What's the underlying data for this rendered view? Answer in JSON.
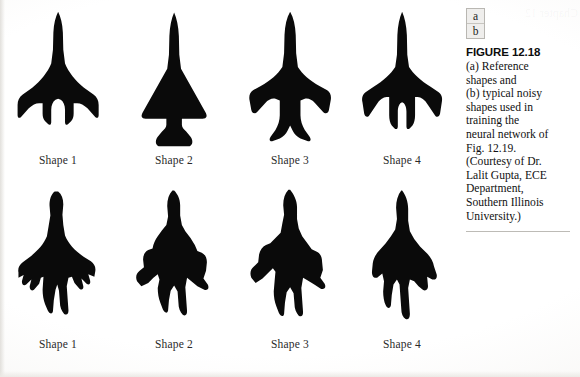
{
  "figure": {
    "panel_key": {
      "top": "a",
      "bottom": "b"
    },
    "heading": "FIGURE 12.18",
    "caption_lines": [
      "(a) Reference",
      "shapes and",
      "(b) typical noisy",
      "shapes used in",
      "training the",
      "neural network of",
      "Fig. 12.19.",
      "(Courtesy of Dr.",
      "Lalit Gupta, ECE",
      "Department,",
      "Southern Illinois",
      "University.)"
    ],
    "caption_text": "(a) Reference shapes and (b) typical noisy shapes used in training the neural network of Fig. 12.19. (Courtesy of Dr. Lalit Gupta, ECE Department, Southern Illinois University.)"
  },
  "colors": {
    "shape_fill": "#0a0a0a",
    "page_background": "#fdfdfc",
    "text": "#111111",
    "rule": "#bdbbb6"
  },
  "rows": [
    {
      "row_name": "reference-shapes",
      "shapes": [
        {
          "label": "Shape 1",
          "icon": "aircraft-silhouette-delta-wing-icon",
          "path": "M50,2 C47,8 45,16 44.5,26 L44,46 L42,62 C38,72 30,82 20,90 L9,98 C5,101 3,105 3,110 L3,122 C3,125 5,126 7,124 L16,114 C20,110 24,108 28,108 L32,108 L32,120 C32,124 33,127 35,129 L38,132 C40,134 42,133 42,130 L42,116 C42,110 44,106 47,104 L50,103 L53,104 C56,106 58,110 58,116 L58,130 C58,133 60,134 62,132 L65,129 C67,127 68,124 68,120 L68,108 L72,108 C76,108 80,110 84,114 L93,124 C95,126 97,125 97,122 L97,110 C97,105 95,101 91,98 L80,90 C70,82 62,72 58,62 L56,46 L55.5,26 C55,16 53,8 50,2 Z"
        },
        {
          "label": "Shape 2",
          "icon": "aircraft-silhouette-solid-triangle-icon",
          "path": "M50,3 C47,10 45,19 44.5,30 L44,52 L42,68 L14,118 C11,123 12,126 17,126 L83,126 C88,126 89,123 86,118 L58,68 L56,52 L55.5,30 C55,19 53,10 50,3 Z M41,126 L59,126 L59,133 C59,136 61,138 64,141 L69,147 C72,151 72,156 68,158 L32,158 C28,156 28,151 31,147 L36,141 C39,138 41,136 41,133 Z"
        },
        {
          "label": "Shape 3",
          "icon": "aircraft-silhouette-swept-wing-icon",
          "path": "M50,2 C46,9 44,18 43.5,29 L43,50 L41,66 C36,74 27,82 16,88 L7,93 C3,96 2,100 3,105 L5,116 C6,120 9,121 12,118 L21,108 C25,104 29,102 33,103 L38,105 L38,122 C38,128 36,134 33,139 L28,146 C25,150 26,153 30,152 L38,149 C42,147 45,144 47,140 L50,134 L53,140 C55,144 58,147 62,149 L70,152 C74,153 75,150 72,146 L67,139 C64,134 62,128 62,122 L62,105 L67,103 C71,102 75,104 79,108 L88,118 C91,121 94,120 95,116 L97,105 C98,100 97,96 93,93 L84,88 C73,82 64,74 59,66 L57,50 L56.5,29 C56,18 54,9 50,2 Z"
        },
        {
          "label": "Shape 4",
          "icon": "aircraft-silhouette-trident-icon",
          "path": "M50,2 C47,9 45,18 44.5,29 L44,52 L42,66 C37,74 28,82 17,89 L8,95 C4,98 3,102 4,107 L6,120 C7,124 10,125 12,122 L20,110 C24,104 28,101 32,101 L35,101 L35,122 C35,127 36,131 38,134 L41,137 C43,139 45,138 45,135 L45,118 C45,112 47,108 50,107 C53,108 55,112 55,118 L55,135 C55,138 57,139 59,137 L62,134 C64,131 65,127 65,122 L65,101 L68,101 C72,101 76,104 80,110 L88,122 C90,125 93,124 94,120 L96,107 C97,102 96,98 92,95 L83,89 C72,82 63,74 58,66 L56,52 L55.5,29 C55,18 53,9 50,2 Z"
        }
      ]
    },
    {
      "row_name": "noisy-shapes",
      "shapes": [
        {
          "label": "Shape 1",
          "icon": "noisy-aircraft-silhouette-delta-wing-icon",
          "path": "M46,4 C42,7 40,13 40,20 L41,32 L39,44 L37,56 C33,66 25,74 16,81 L9,86 C5,89 3,93 4,98 L4,104 L10,101 L8,108 C8,112 10,114 13,112 L19,106 L17,114 C17,118 19,120 22,118 L28,111 L30,104 L33,103 L32,118 C32,124 33,130 35,135 L38,142 C40,146 43,147 44,143 L45,130 L47,118 L49,112 L51,119 L52,132 C52,138 54,143 57,146 C60,148 62,146 62,142 L61,128 L60,114 L62,104 L66,103 L69,110 L75,117 C78,119 80,117 79,113 L77,105 L83,111 C86,113 88,111 87,107 L85,100 L92,103 L93,97 C94,92 92,88 88,85 L80,80 C70,73 62,65 58,55 L56,43 L55,31 L56,19 C56,12 54,7 50,4 Z"
        },
        {
          "label": "Shape 2",
          "icon": "noisy-aircraft-silhouette-solid-icon",
          "path": "M48,3 C44,7 42,13 42,21 L43,33 L41,43 L36,49 L31,56 C28,60 26,65 25,70 L20,72 C16,74 14,78 14,83 L15,92 L10,96 C6,99 5,104 7,108 L12,114 L20,110 L26,104 L31,100 L33,106 L31,116 C31,122 32,128 34,133 L37,141 C39,145 42,146 43,142 L44,130 L46,119 L50,113 L54,120 L55,133 C55,139 57,144 60,147 C63,149 65,147 65,143 L64,129 L63,115 L65,104 L70,108 L77,114 L85,118 C89,119 91,116 89,112 L84,105 L87,96 L88,86 C88,81 86,77 82,75 L77,73 L74,66 L69,58 L63,50 L59,43 L57,32 L57,20 C57,13 54,7 50,3 Z"
        },
        {
          "label": "Shape 3",
          "icon": "noisy-aircraft-silhouette-swept-wing-icon",
          "path": "M48,2 C44,6 42,12 42,20 L43,31 L41,41 L39,52 L33,58 L27,64 L22,66 C18,68 15,72 14,77 L13,86 L8,91 C4,94 3,99 5,104 L10,110 L18,105 L25,98 L30,93 L33,97 L32,108 L31,120 C31,126 32,132 34,137 L37,145 C39,149 42,150 43,146 L44,133 L46,121 L50,115 L54,122 L55,134 C55,140 57,145 60,148 C63,150 65,148 65,144 L64,130 L63,116 L65,104 L70,107 L78,112 L86,117 C90,118 92,115 90,111 L85,104 L88,95 L87,85 C87,80 85,76 81,74 L75,71 L70,64 L64,56 L60,47 L58,36 L58,22 C58,14 54,7 50,2 Z"
        },
        {
          "label": "Shape 4",
          "icon": "noisy-aircraft-silhouette-trident-icon",
          "path": "M49,3 C45,8 43,15 43,23 L44,36 L42,48 L37,56 L31,64 L24,72 C20,76 17,81 16,87 L15,97 C15,102 17,105 21,104 L27,99 L29,108 L28,120 C28,126 29,132 31,136 C33,140 36,140 37,136 L38,124 L40,112 L44,106 L47,112 L48,126 L49,140 C49,146 51,150 54,152 C57,153 59,151 59,146 L58,131 L57,116 L59,106 L64,108 L69,114 L74,118 C77,120 80,118 80,114 L79,103 L85,106 C89,107 91,104 90,100 L87,91 C86,85 83,80 79,76 L71,68 L64,59 L59,50 L57,38 L57,24 C57,16 54,8 50,3 Z"
        }
      ]
    }
  ]
}
